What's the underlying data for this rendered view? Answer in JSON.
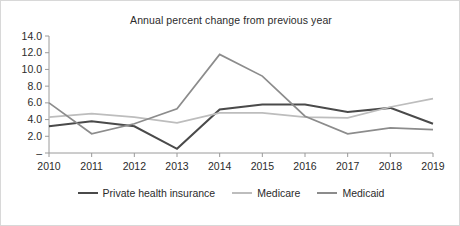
{
  "chart_data": {
    "type": "line",
    "title": "Annual percent change from previous year",
    "xlabel": "",
    "ylabel": "",
    "x": [
      2010,
      2011,
      2012,
      2013,
      2014,
      2015,
      2016,
      2017,
      2018,
      2019
    ],
    "categories": [
      "2010",
      "2011",
      "2012",
      "2013",
      "2014",
      "2015",
      "2016",
      "2017",
      "2018",
      "2019"
    ],
    "ylim": [
      0,
      14
    ],
    "ytick_values": [
      0,
      2,
      4,
      6,
      8,
      10,
      12,
      14
    ],
    "ytick_labels": [
      "–",
      "2.0",
      "4.0",
      "6.0",
      "8.0",
      "10.0",
      "12.0",
      "14.0"
    ],
    "grid": false,
    "legend_position": "bottom",
    "series": [
      {
        "name": "Private health insurance",
        "color": "#4a4a4a",
        "width": 2.1,
        "values": [
          3.2,
          3.8,
          3.2,
          0.5,
          5.2,
          5.8,
          5.8,
          4.9,
          5.4,
          3.5
        ]
      },
      {
        "name": "Medicare",
        "color": "#bdbdbd",
        "width": 1.7,
        "values": [
          4.3,
          4.7,
          4.3,
          3.6,
          4.8,
          4.8,
          4.3,
          4.2,
          5.5,
          6.5
        ]
      },
      {
        "name": "Medicaid",
        "color": "#8c8c8c",
        "width": 1.7,
        "values": [
          6.0,
          2.3,
          3.5,
          5.3,
          11.8,
          9.2,
          4.4,
          2.3,
          3.0,
          2.8
        ]
      }
    ]
  },
  "legend": {
    "items": [
      {
        "label": "Private health insurance"
      },
      {
        "label": "Medicare"
      },
      {
        "label": "Medicaid"
      }
    ]
  }
}
